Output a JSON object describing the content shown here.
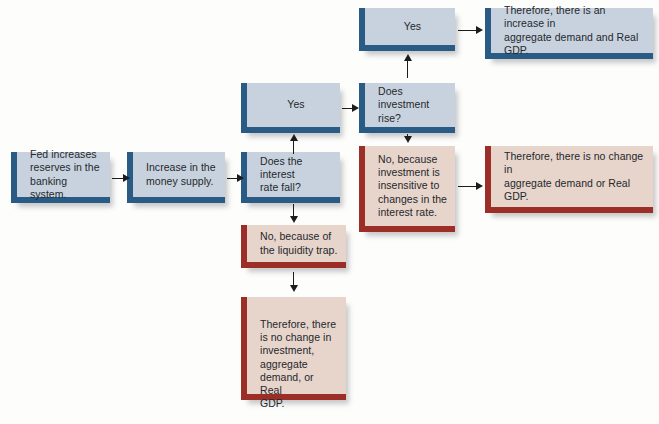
{
  "diagram": {
    "type": "flowchart",
    "orientation": "left-to-right",
    "palette": {
      "blue_fill": "#c8d2de",
      "blue_accent": "#2a5b85",
      "red_fill": "#e7d4cb",
      "red_accent": "#9c2e28",
      "text": "#24282c",
      "connector": "#1c1c1c",
      "background": "#fdfdfc"
    },
    "nodes": {
      "fed_reserves": {
        "text": "Fed increases\nreserves in the\nbanking system.",
        "style": "blue",
        "align": "left"
      },
      "money_supply": {
        "text": "Increase in the\nmoney supply.",
        "style": "blue",
        "align": "left"
      },
      "interest_rate_question": {
        "text": "Does the interest\nrate fall?",
        "style": "blue",
        "align": "left"
      },
      "interest_yes": {
        "text": "Yes",
        "style": "blue",
        "align": "center"
      },
      "liquidity_trap": {
        "text": "No, because of\nthe liquidity trap.",
        "style": "red",
        "align": "left"
      },
      "no_change_investment": {
        "text": "Therefore, there\nis no change in\ninvestment,\naggregate\ndemand, or Real\nGDP.",
        "style": "red",
        "align": "left"
      },
      "investment_question": {
        "text": "Does investment\nrise?",
        "style": "blue",
        "align": "left"
      },
      "investment_yes": {
        "text": "Yes",
        "style": "blue",
        "align": "center"
      },
      "investment_insensitive": {
        "text": "No, because\ninvestment is\ninsensitive to\nchanges in the\ninterest rate.",
        "style": "red",
        "align": "left"
      },
      "increase_ad_gdp": {
        "text": "Therefore, there is an increase in\naggregate demand and Real GDP.",
        "style": "blue",
        "align": "left"
      },
      "no_change_ad_gdp": {
        "text": "Therefore, there is no change in\naggregate demand or Real GDP.",
        "style": "red",
        "align": "left"
      }
    },
    "edges": [
      {
        "from": "fed_reserves",
        "to": "money_supply",
        "direction": "right",
        "label": ""
      },
      {
        "from": "money_supply",
        "to": "interest_rate_question",
        "direction": "right",
        "label": ""
      },
      {
        "from": "interest_rate_question",
        "to": "interest_yes",
        "direction": "up",
        "label": ""
      },
      {
        "from": "interest_rate_question",
        "to": "liquidity_trap",
        "direction": "down",
        "label": ""
      },
      {
        "from": "liquidity_trap",
        "to": "no_change_investment",
        "direction": "down",
        "label": ""
      },
      {
        "from": "interest_yes",
        "to": "investment_question",
        "direction": "right",
        "label": ""
      },
      {
        "from": "investment_question",
        "to": "investment_yes",
        "direction": "up",
        "label": ""
      },
      {
        "from": "investment_question",
        "to": "investment_insensitive",
        "direction": "down",
        "label": ""
      },
      {
        "from": "investment_yes",
        "to": "increase_ad_gdp",
        "direction": "right",
        "label": ""
      },
      {
        "from": "investment_insensitive",
        "to": "no_change_ad_gdp",
        "direction": "right",
        "label": ""
      }
    ]
  }
}
